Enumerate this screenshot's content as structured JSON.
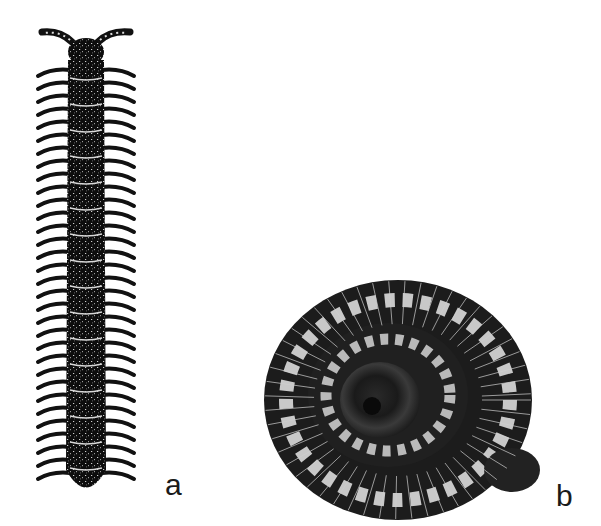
{
  "figure": {
    "panels": [
      {
        "id": "a",
        "label": "a",
        "subject": "millipede-dorsal-view-illustration"
      },
      {
        "id": "b",
        "label": "b",
        "subject": "coiled-millipede-illustration"
      }
    ],
    "colors": {
      "ink": "#111111",
      "highlight": "#e8e8e8",
      "background": "#ffffff"
    }
  }
}
